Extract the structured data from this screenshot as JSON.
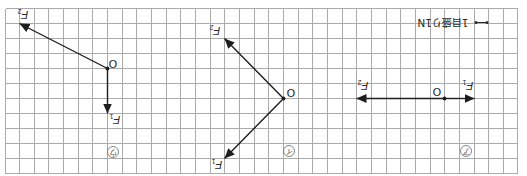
{
  "scale_note": {
    "label": "1目盛り1N"
  },
  "grid": {
    "columns": 35,
    "rows": 11
  },
  "panels": [
    {
      "label": "ウ",
      "position": "left",
      "origin": "O",
      "forces": [
        {
          "symbol": "F",
          "subscript": "1",
          "dx": 0,
          "dy": 3
        },
        {
          "symbol": "F",
          "subscript": "2",
          "dx": -6,
          "dy": -3
        }
      ]
    },
    {
      "label": "イ",
      "position": "middle",
      "origin": "O",
      "forces": [
        {
          "symbol": "F",
          "subscript": "1",
          "dx": -4,
          "dy": 4
        },
        {
          "symbol": "F",
          "subscript": "2",
          "dx": -4,
          "dy": -4
        }
      ]
    },
    {
      "label": "ア",
      "position": "right",
      "origin": "O",
      "forces": [
        {
          "symbol": "F",
          "subscript": "1",
          "dx": 2,
          "dy": 0
        },
        {
          "symbol": "F",
          "subscript": "2",
          "dx": -6,
          "dy": 0
        }
      ]
    }
  ]
}
